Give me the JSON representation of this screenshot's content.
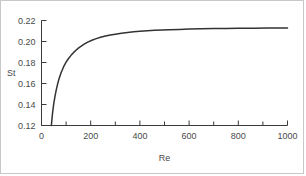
{
  "chart_data": {
    "type": "line",
    "title": "",
    "xlabel": "Re",
    "ylabel": "St",
    "xlim": [
      0,
      1000
    ],
    "ylim": [
      0.12,
      0.22
    ],
    "grid": false,
    "legend": null,
    "x_ticks_major": [
      0,
      200,
      400,
      600,
      800,
      1000
    ],
    "x_tick_labels": [
      "0",
      "200",
      "400",
      "600",
      "800",
      "1000"
    ],
    "x_ticks_minor": [
      100,
      300,
      500,
      700,
      900
    ],
    "y_ticks_major": [
      0.12,
      0.14,
      0.16,
      0.18,
      0.2,
      0.22
    ],
    "y_tick_labels": [
      "0.12",
      "0.14",
      "0.16",
      "0.18",
      "0.20",
      "0.22"
    ],
    "y_ticks_minor": [],
    "series": [
      {
        "name": "Strouhal number curve",
        "color": "#333333",
        "x": [
          40,
          45,
          50,
          55,
          60,
          65,
          70,
          75,
          80,
          90,
          100,
          110,
          120,
          130,
          140,
          150,
          160,
          175,
          190,
          205,
          220,
          240,
          260,
          280,
          300,
          325,
          350,
          375,
          400,
          430,
          460,
          490,
          520,
          560,
          600,
          650,
          700,
          750,
          800,
          860,
          920,
          1000
        ],
        "y": [
          0.12,
          0.132,
          0.141,
          0.148,
          0.154,
          0.159,
          0.1635,
          0.1672,
          0.1705,
          0.176,
          0.1803,
          0.1838,
          0.1868,
          0.1894,
          0.1917,
          0.1937,
          0.1954,
          0.1977,
          0.1996,
          0.2012,
          0.2025,
          0.204,
          0.2052,
          0.2062,
          0.207,
          0.2079,
          0.2086,
          0.2092,
          0.2097,
          0.2102,
          0.2106,
          0.211,
          0.2112,
          0.2115,
          0.2118,
          0.2121,
          0.2123,
          0.2124,
          0.2126,
          0.2127,
          0.2128,
          0.2129
        ]
      }
    ],
    "annotations": []
  },
  "axes": {
    "spine_color": "#3a3a3a",
    "tick_color": "#3a3a3a",
    "label_color": "#4a4a4a"
  },
  "figure": {
    "background": "#ffffff",
    "border_color": "#c8c8c8"
  }
}
